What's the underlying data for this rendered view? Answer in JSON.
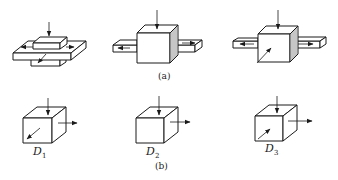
{
  "figure": {
    "part_a": {
      "caption": "(a)",
      "panels": [
        {
          "name": "stacked-plates-shear",
          "description": "block on crossed plates with vertical load and in-plane arrows"
        },
        {
          "name": "cube-with-side-plates-2arrows",
          "description": "cube with plates left and right, arrows pulling outward"
        },
        {
          "name": "cube-with-side-plates-3arrows",
          "description": "cube with plates, vertical, lateral and oblique arrows"
        }
      ]
    },
    "part_b": {
      "caption": "(b)",
      "cubes": [
        {
          "label_main": "D",
          "label_sub": "1"
        },
        {
          "label_main": "D",
          "label_sub": "2"
        },
        {
          "label_main": "D",
          "label_sub": "3"
        }
      ]
    }
  },
  "colors": {
    "line": "#1a1a1a",
    "background": "#ffffff"
  }
}
